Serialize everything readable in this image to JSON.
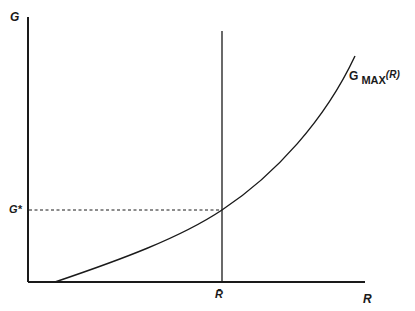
{
  "diagram": {
    "y_axis_label": "G",
    "x_axis_label": "R",
    "threshold_level_label": "G*",
    "r_bar_label": "R̄",
    "curve_label_main": "G",
    "curve_label_sub": "MAX",
    "curve_label_arg": "(R)",
    "colors": {
      "line": "#1a1a1a",
      "background": "#ffffff"
    },
    "elements": [
      "vertical axis G",
      "horizontal axis R",
      "convex increasing curve G_MAX(R)",
      "vertical line at R-bar",
      "dashed horizontal line at G*"
    ]
  }
}
